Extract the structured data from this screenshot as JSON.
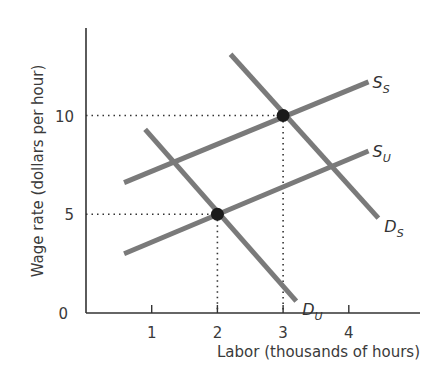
{
  "chart_data": {
    "type": "line",
    "title": "",
    "xlabel": "Labor (thousands of hours)",
    "ylabel": "Wage rate (dollars per hour)",
    "xlim": [
      0,
      5
    ],
    "ylim": [
      0,
      14.5
    ],
    "x_ticks": [
      "1",
      "2",
      "3",
      "4"
    ],
    "y_ticks": [
      "0",
      "5",
      "10"
    ],
    "grid": false,
    "series": [
      {
        "name": "S_S",
        "label_main": "S",
        "label_sub": "S",
        "kind": "supply (union sector... shifted)",
        "points": [
          [
            0.58,
            6.6
          ],
          [
            4.3,
            11.7
          ]
        ]
      },
      {
        "name": "S_U",
        "label_main": "S",
        "label_sub": "U",
        "kind": "supply",
        "points": [
          [
            0.58,
            3.0
          ],
          [
            4.3,
            8.2
          ]
        ]
      },
      {
        "name": "D_S",
        "label_main": "D",
        "label_sub": "S",
        "kind": "demand",
        "points": [
          [
            2.2,
            13.1
          ],
          [
            4.45,
            4.8
          ]
        ]
      },
      {
        "name": "D_U",
        "label_main": "D",
        "label_sub": "U",
        "kind": "demand",
        "points": [
          [
            0.9,
            9.3
          ],
          [
            3.2,
            0.6
          ]
        ]
      }
    ],
    "equilibria": [
      {
        "x": 2,
        "y": 5
      },
      {
        "x": 3,
        "y": 10
      }
    ],
    "colors": {
      "curve": "#7a7a7a",
      "axis": "#333333",
      "dot": "#1a1a1a"
    }
  }
}
